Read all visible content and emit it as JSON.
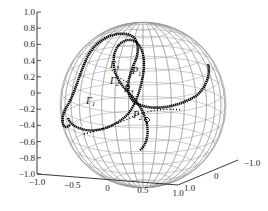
{
  "chart_data": {
    "type": "scatter3d",
    "title": "",
    "axes": {
      "z": {
        "ticks": [
          "1.0",
          "0.8",
          "0.6",
          "0.4",
          "0.2",
          "0",
          "-0.2",
          "-0.4",
          "-0.6",
          "-0.8",
          "-1.0"
        ],
        "range": [
          -1.0,
          1.0
        ]
      },
      "x": {
        "ticks": [
          "-1.0",
          "-0.5",
          "0",
          "0.5",
          "1.0"
        ],
        "range": [
          -1.0,
          1.0
        ]
      },
      "y": {
        "ticks": [
          "1.0",
          "0",
          "-1.0"
        ],
        "range": [
          -1.0,
          1.0
        ]
      }
    },
    "grid": false,
    "sphere": {
      "radius": 1.0,
      "wireframe": true,
      "color": "#9a9a9a"
    },
    "curves": [
      {
        "name": "Γ1",
        "label": "Γ",
        "sub": "1",
        "style": "thick-dotted",
        "color": "#000000"
      },
      {
        "name": "Γ2",
        "label": "Γ",
        "sub": "2",
        "style": "dotted",
        "color": "#000000"
      },
      {
        "name": "Γ3",
        "label": "Γ",
        "sub": "3",
        "style": "thick-dotted",
        "color": "#000000"
      }
    ],
    "points": [
      {
        "name": "P1",
        "label": "P",
        "sub": "1"
      },
      {
        "name": "P2",
        "label": "P",
        "sub": "2",
        "marker": "diamond"
      },
      {
        "name": "P3",
        "label": "P",
        "sub": "3"
      }
    ]
  }
}
